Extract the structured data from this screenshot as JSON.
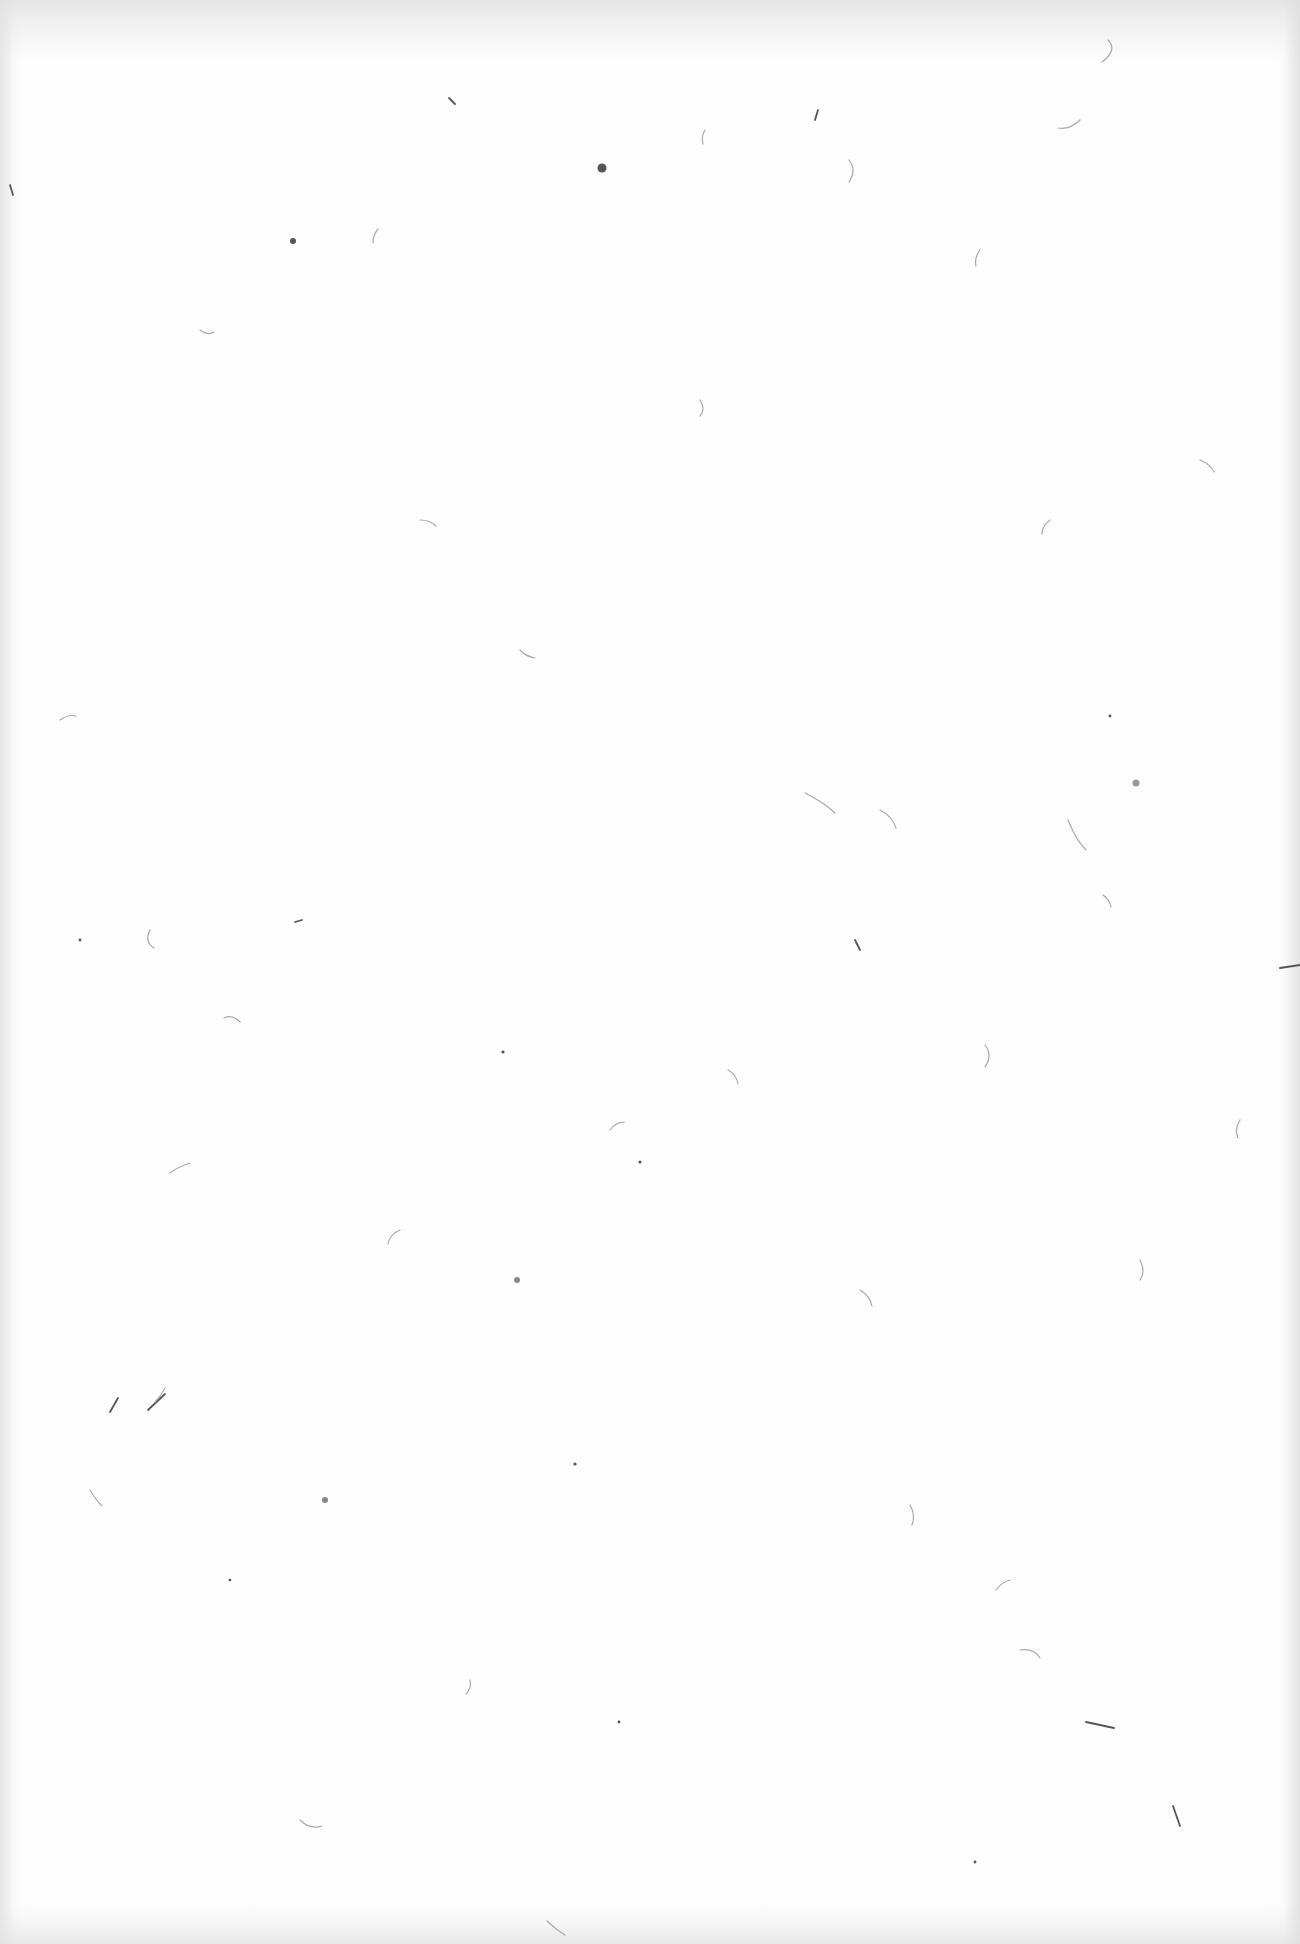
{
  "scene": {
    "subject": "blank textured paper sheet",
    "description": "Plain white handmade/rice paper with scattered fibers and specks; no text or UI present",
    "colors": {
      "paper": "#fdfdfd",
      "edge_shade": "#e1e1e1",
      "fiber_dark": "#555555",
      "fiber_light": "#c8c8c8"
    }
  }
}
